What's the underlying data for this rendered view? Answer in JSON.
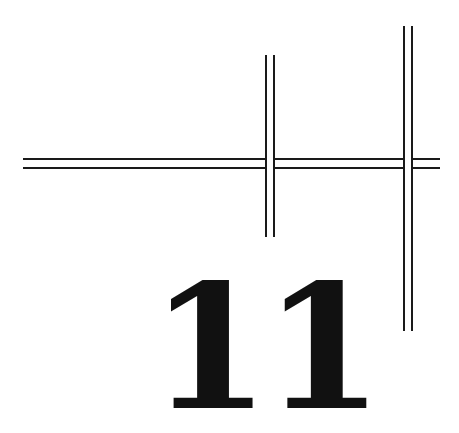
{
  "chapter": {
    "number": "11"
  },
  "ornament": {
    "line_color": "#1a1a1a",
    "horizontal_rule": {
      "y_top": 159,
      "y_bottom": 168,
      "x_start": 23,
      "x_end": 440
    },
    "vertical_rules": [
      {
        "x_left": 265,
        "x_right": 274,
        "y_start": 55,
        "y_end": 237
      },
      {
        "x_left": 403,
        "x_right": 412,
        "y_start": 26,
        "y_end": 331
      }
    ]
  }
}
